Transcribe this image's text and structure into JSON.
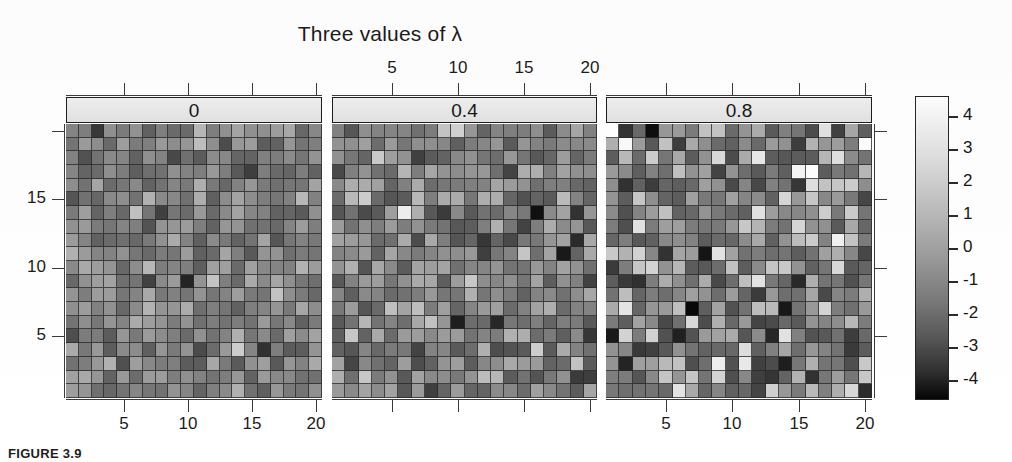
{
  "figure": {
    "title": "Three values of λ",
    "caption": "FIGURE 3.9",
    "type": "faceted-grayscale-heatmap"
  },
  "chart_data": {
    "type": "heatmap",
    "title": "Three values of λ",
    "xlabel": "",
    "ylabel": "",
    "grid": true,
    "legend_position": "right",
    "panels": [
      {
        "label": "0",
        "lambda": 0,
        "sd": 1.0,
        "seed": 11
      },
      {
        "label": "0.4",
        "lambda": 0.4,
        "sd": 1.35,
        "seed": 37
      },
      {
        "label": "0.8",
        "lambda": 0.8,
        "sd": 1.8,
        "seed": 73
      }
    ],
    "nx": 20,
    "ny": 20,
    "xlim": [
      0.5,
      20.5
    ],
    "ylim": [
      0.5,
      20.5
    ],
    "x_ticks": [
      5,
      10,
      15,
      20
    ],
    "x_tick_labels": [
      "5",
      "10",
      "15",
      "20"
    ],
    "y_ticks": [
      5,
      10,
      15
    ],
    "y_tick_labels": [
      "5",
      "10",
      "15"
    ],
    "top_axis_ticks": [
      5,
      10,
      15,
      20
    ],
    "top_axis_tick_labels": [
      "5",
      "10",
      "15",
      "20"
    ],
    "colorbar": {
      "min": -4.6,
      "max": 4.6,
      "ticks": [
        4,
        3,
        2,
        1,
        0,
        -1,
        -2,
        -3,
        -4
      ],
      "tick_labels": [
        "4",
        "3",
        "2",
        "1",
        "0",
        "-1",
        "-2",
        "-3",
        "-4"
      ],
      "colormap": "grayscale",
      "low_color": "#000000",
      "high_color": "#ffffff"
    }
  },
  "colors": {
    "strip_fill": "#ebebeb",
    "border": "#1e1e1e",
    "text": "#1b1b1b",
    "cell_border": "#282828"
  }
}
